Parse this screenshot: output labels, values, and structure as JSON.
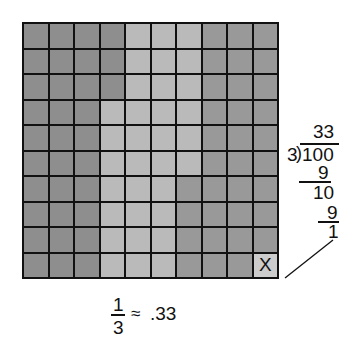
{
  "figure": {
    "grid": {
      "rows": 10,
      "cols": 10,
      "order": "column-major",
      "groups": [
        {
          "name": "first-third",
          "count": 33,
          "color": "#8e8e8e"
        },
        {
          "name": "second-third",
          "count": 33,
          "color": "#bababa"
        },
        {
          "name": "third-third",
          "count": 33,
          "color": "#999999"
        },
        {
          "name": "remainder",
          "count": 1,
          "color": "#cccccc",
          "mark": "X"
        }
      ]
    },
    "division": {
      "quotient": "33",
      "divisor": "3",
      "dividend": "100",
      "step1_subtract": "9",
      "step1_result": "10",
      "step2_subtract": "9",
      "remainder": "1",
      "bracket": ")"
    },
    "caption": {
      "numerator": "1",
      "denominator": "3",
      "approx_symbol": "≈",
      "value": ".33"
    }
  }
}
